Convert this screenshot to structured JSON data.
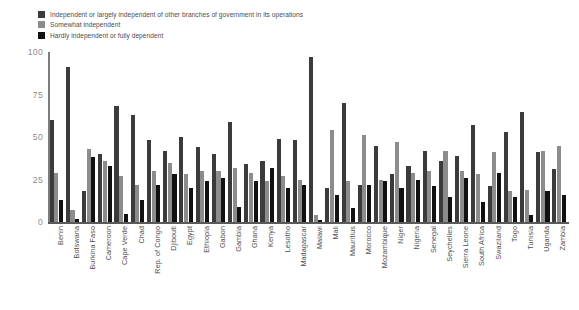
{
  "chart_data": {
    "type": "bar",
    "title": "",
    "subtitle": "",
    "xlabel": "",
    "ylabel": "",
    "ylim": [
      0,
      100
    ],
    "yticks": [
      "0",
      "25",
      "50",
      "75",
      "100"
    ],
    "ytick_values": [
      0,
      25,
      50,
      75,
      100
    ],
    "grid": false,
    "legend_position": "top-left",
    "orientation": "vertical",
    "grouping": "grouped",
    "categories": [
      "Benin",
      "Botswana",
      "Burkina Faso",
      "Cameroon",
      "Cape Verde",
      "Chad",
      "Rep. of Congo",
      "Djibouti",
      "Egypt",
      "Ethiopia",
      "Gabon",
      "Gambia",
      "Ghana",
      "Kenya",
      "Lesotho",
      "Madagascar",
      "Malawi",
      "Mali",
      "Mauritius",
      "Morocco",
      "Mozambique",
      "Niger",
      "Nigeria",
      "Senegal",
      "Seychelles",
      "Sierra Leone",
      "South Africa",
      "Swaziland",
      "Togo",
      "Tunisia",
      "Uganda",
      "Zambia"
    ],
    "series": [
      {
        "name": "Independent or largely independent of other branches of government in its operations",
        "color": "#3b3b3b",
        "values": [
          60,
          91,
          18,
          40,
          68,
          63,
          48,
          42,
          50,
          44,
          40,
          59,
          34,
          36,
          49,
          48,
          97,
          20,
          70,
          22,
          45,
          28,
          33,
          42,
          36,
          39,
          57,
          21,
          53,
          65,
          41,
          31
        ]
      },
      {
        "name": "Somewhat independent",
        "color": "#8c8c8c",
        "values": [
          29,
          7,
          43,
          36,
          27,
          22,
          30,
          35,
          28,
          30,
          30,
          32,
          29,
          24,
          27,
          25,
          4,
          54,
          24,
          51,
          25,
          47,
          29,
          30,
          42,
          30,
          28,
          41,
          18,
          19,
          42,
          45
        ]
      },
      {
        "name": "Hardly independent or fully dependent",
        "color": "#111111",
        "values": [
          13,
          2,
          38,
          33,
          5,
          13,
          22,
          28,
          20,
          24,
          26,
          9,
          24,
          32,
          20,
          22,
          1,
          16,
          8,
          22,
          24,
          20,
          25,
          21,
          15,
          26,
          12,
          29,
          15,
          4,
          18,
          16
        ]
      }
    ]
  },
  "legend": {
    "items": [
      {
        "label": "Independent or largely independent of other branches of government in its operations",
        "color": "#3b3b3b"
      },
      {
        "label": "Somewhat independent",
        "color": "#8c8c8c"
      },
      {
        "label": "Hardly independent or fully dependent",
        "color": "#111111"
      }
    ]
  }
}
